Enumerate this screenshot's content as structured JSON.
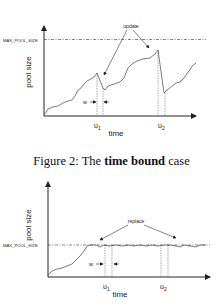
{
  "figure_top": {
    "y_axis_label": "pool size",
    "x_axis_label": "time",
    "max_label": "MAX_POOL_SIZE",
    "annotation": "update",
    "w_label": "w",
    "u1": "u",
    "u1_sub": "1",
    "u2": "u",
    "u2_sub": "2"
  },
  "caption": {
    "prefix": "Figure 2: The ",
    "bold": "time bound",
    "suffix": " case"
  },
  "figure_bottom": {
    "y_axis_label": "pool size",
    "x_axis_label": "time",
    "max_label": "MAX_POOL_SIZE",
    "annotation": "replace",
    "w_label": "w",
    "u1": "u",
    "u1_sub": "1",
    "u2": "u",
    "u2_sub": "2"
  }
}
